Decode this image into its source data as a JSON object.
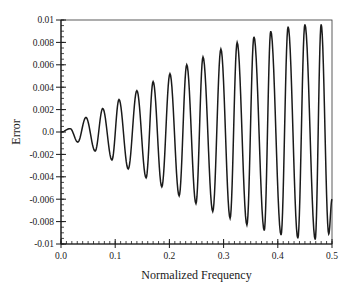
{
  "chart_data": {
    "type": "line",
    "title": "",
    "xlabel": "Normalized Frequency",
    "ylabel": "Error",
    "xlim": [
      0.0,
      0.5
    ],
    "ylim": [
      -0.01,
      0.01
    ],
    "grid": false,
    "legend": null,
    "x_ticks": [
      "0.0",
      "0.1",
      "0.2",
      "0.3",
      "0.4",
      "0.5"
    ],
    "x_tick_values": [
      0.0,
      0.1,
      0.2,
      0.3,
      0.4,
      0.5
    ],
    "y_ticks": [
      "0.01",
      "0.008",
      "0.006",
      "0.004",
      "0.002",
      "0.0",
      "-0.002",
      "-0.004",
      "-0.006",
      "-0.008",
      "-0.01"
    ],
    "y_tick_values": [
      0.01,
      0.008,
      0.006,
      0.004,
      0.002,
      0.0,
      -0.002,
      -0.004,
      -0.006,
      -0.008,
      -0.01
    ],
    "series": [
      {
        "name": "Error",
        "color": "#1a1a1a",
        "extrema": [
          [
            0.0,
            0.0
          ],
          [
            0.017,
            0.0003
          ],
          [
            0.031,
            -0.0009
          ],
          [
            0.046,
            0.0013
          ],
          [
            0.063,
            -0.0017
          ],
          [
            0.077,
            0.0021
          ],
          [
            0.094,
            -0.0025
          ],
          [
            0.107,
            0.0029
          ],
          [
            0.124,
            -0.0033
          ],
          [
            0.14,
            0.0037
          ],
          [
            0.157,
            -0.0041
          ],
          [
            0.17,
            0.0045
          ],
          [
            0.186,
            -0.0049
          ],
          [
            0.201,
            0.0052
          ],
          [
            0.218,
            -0.0057
          ],
          [
            0.232,
            0.006
          ],
          [
            0.249,
            -0.0064
          ],
          [
            0.262,
            0.0067
          ],
          [
            0.28,
            -0.0071
          ],
          [
            0.295,
            0.0074
          ],
          [
            0.312,
            -0.0077
          ],
          [
            0.325,
            0.008
          ],
          [
            0.343,
            -0.0083
          ],
          [
            0.356,
            0.0085
          ],
          [
            0.375,
            -0.0088
          ],
          [
            0.387,
            0.009
          ],
          [
            0.406,
            -0.0092
          ],
          [
            0.419,
            0.0094
          ],
          [
            0.437,
            -0.0095
          ],
          [
            0.45,
            0.0096
          ],
          [
            0.469,
            -0.0096
          ],
          [
            0.48,
            0.0096
          ],
          [
            0.494,
            -0.0091
          ],
          [
            0.5,
            -0.006
          ]
        ]
      }
    ]
  }
}
